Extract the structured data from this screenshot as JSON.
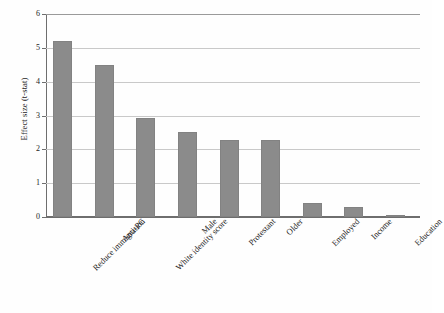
{
  "chart_data": {
    "type": "bar",
    "title": "",
    "subtitle": "",
    "xlabel": "",
    "ylabel": "Effect size (t-stat)",
    "categories": [
      "Reduce immigration",
      "Anti-PC",
      "White identity score",
      "Male",
      "Protestant",
      "Older",
      "Employed",
      "Income",
      "Education"
    ],
    "values": [
      5.2,
      4.5,
      2.92,
      2.52,
      2.27,
      2.27,
      0.4,
      0.3,
      0.03
    ],
    "ylim": [
      0,
      6
    ],
    "ytick_labels": [
      "0",
      "1",
      "2",
      "3",
      "4",
      "5",
      "6"
    ],
    "ytick_values": [
      0,
      1,
      2,
      3,
      4,
      5,
      6
    ],
    "grid": "horizontal",
    "legend": "none",
    "bar_color": "#8b8b8b",
    "gridline_color": "#c9c9c9",
    "axis_color": "#6e6e6e",
    "background_color": "#fefefe"
  }
}
